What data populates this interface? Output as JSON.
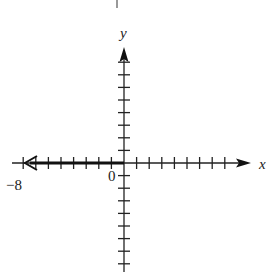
{
  "diagram": {
    "type": "number-line-on-coordinate-axes",
    "axes": {
      "x_label": "x",
      "y_label": "y",
      "origin_label": "0",
      "left_label": "−8",
      "x_ticks_left": 8,
      "x_ticks_right": 8,
      "y_ticks_up": 8,
      "y_ticks_down": 8
    },
    "highlighted_ray": {
      "from": 0,
      "direction": "left",
      "endpoint": "closed-at-axis-arrow"
    }
  },
  "colors": {
    "axis": "#222222",
    "ray": "#111111",
    "background": "#ffffff"
  }
}
